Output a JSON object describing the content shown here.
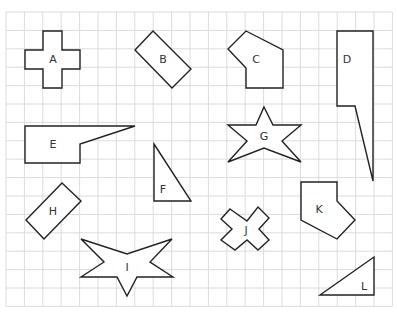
{
  "grid": {
    "x0": 6,
    "y0": 12,
    "cols": 21,
    "rows": 16,
    "cell": 18.4,
    "color": "#dcdcdc"
  },
  "shapes": [
    {
      "label": "A",
      "points": "43,31 62,31 62,50 80,50 80,69 62,69 62,88 43,88 43,69 25,69 25,50 43,50",
      "lx": 53,
      "ly": 60
    },
    {
      "label": "B",
      "points": "153,31 191,69 172,88 135,50",
      "lx": 163,
      "ly": 60
    },
    {
      "label": "C",
      "points": "246,31 283,50 283,88 246,88 246,68 228,49",
      "lx": 256,
      "ly": 60
    },
    {
      "label": "D",
      "points": "337,31 373,31 373,181 355,106 337,106",
      "lx": 347,
      "ly": 60
    },
    {
      "label": "E",
      "points": "25,126 135,126 80,144 80,163 25,163",
      "lx": 53,
      "ly": 145
    },
    {
      "label": "F",
      "points": "154,144 191,201 154,201",
      "lx": 163,
      "ly": 190
    },
    {
      "label": "G",
      "points": "264,107 273,125 301,125 282,141 301,162 264,148 228,162 247,141 228,125 256,125",
      "lx": 264,
      "ly": 137
    },
    {
      "label": "H",
      "points": "62,183 81,201 44,239 26,220",
      "lx": 53,
      "ly": 212
    },
    {
      "label": "I",
      "points": "81,239 127,254 172,239 150,262 173,277 137,277 127,296 117,277 81,277 104,262",
      "lx": 127,
      "ly": 268
    },
    {
      "label": "J",
      "points": "230,209 247,221 258,207 269,218 259,229 269,240 258,250 247,240 235,250 221,240 232,229 221,219",
      "lx": 246,
      "ly": 231
    },
    {
      "label": "K",
      "points": "301,182 337,182 337,201 355,220 337,239 301,220",
      "lx": 319,
      "ly": 210
    },
    {
      "label": "L",
      "points": "320,295 374,257 374,295",
      "lx": 364,
      "ly": 287
    }
  ]
}
